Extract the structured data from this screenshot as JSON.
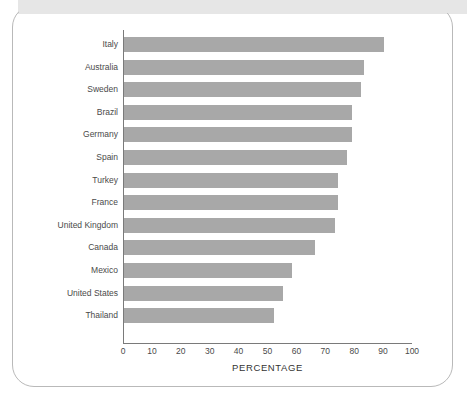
{
  "figure": {
    "frame_color": "#b9b9b9",
    "header_band_color": "#e6e6e6",
    "bar_color": "#a8a8a8",
    "axis_color": "#7a7a7a",
    "text_color": "#4a4a4a"
  },
  "chart_data": {
    "type": "bar",
    "orientation": "horizontal",
    "title": "",
    "subtitle": "",
    "xlabel": "PERCENTAGE",
    "ylabel": "",
    "xlim": [
      0,
      100
    ],
    "xticks": [
      0,
      10,
      20,
      30,
      40,
      50,
      60,
      70,
      80,
      90,
      100
    ],
    "xtick_labels": [
      "0",
      "10",
      "20",
      "30",
      "40",
      "50",
      "60",
      "70",
      "80",
      "90",
      "100"
    ],
    "grid": false,
    "legend": null,
    "categories": [
      "Italy",
      "Australia",
      "Sweden",
      "Brazil",
      "Germany",
      "Spain",
      "Turkey",
      "France",
      "United Kingdom",
      "Canada",
      "Mexico",
      "United States",
      "Thailand"
    ],
    "values": [
      90,
      83,
      82,
      79,
      79,
      77,
      74,
      74,
      73,
      66,
      58,
      55,
      52
    ]
  }
}
